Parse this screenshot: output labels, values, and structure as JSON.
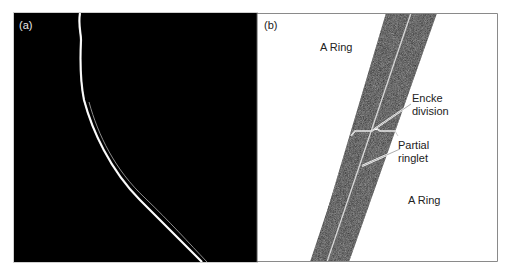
{
  "figure": {
    "panels": [
      {
        "id": "a",
        "label": "(a)",
        "background": "#000000"
      },
      {
        "id": "b",
        "label": "(b)",
        "background": "#ffffff",
        "annotations": {
          "a_ring_top": "A Ring",
          "encke_line1": "Encke",
          "encke_line2": "division",
          "partial_line1": "Partial",
          "partial_line2": "ringlet",
          "a_ring_bottom": "A Ring"
        }
      }
    ],
    "colors": {
      "panel_a_bg": "#000000",
      "ring_strand": "#d8d8d8",
      "band_dark": "#1c1c1c",
      "frame": "#7a7a7a",
      "leader": "#ffffff"
    }
  }
}
